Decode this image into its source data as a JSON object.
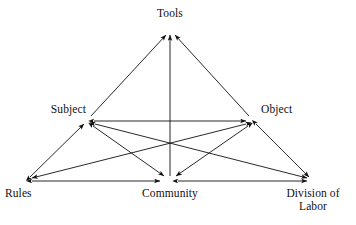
{
  "diagram": {
    "type": "activity-theory-triangle",
    "background_color": "#ffffff",
    "line_color": "#111111",
    "nodes": [
      {
        "id": "tools",
        "label": "Tools",
        "x": 170,
        "y": 30
      },
      {
        "id": "subject",
        "label": "Subject",
        "x": 88,
        "y": 120
      },
      {
        "id": "object",
        "label": "Object",
        "x": 252,
        "y": 120
      },
      {
        "id": "rules",
        "label": "Rules",
        "x": 26,
        "y": 181
      },
      {
        "id": "community",
        "label": "Community",
        "x": 169,
        "y": 181
      },
      {
        "id": "division",
        "label_line1": "Division of",
        "label_line2": "Labor",
        "x": 313,
        "y": 181
      }
    ],
    "edges": [
      {
        "from": "subject",
        "to": "tools",
        "arrows": "to"
      },
      {
        "from": "object",
        "to": "tools",
        "arrows": "to"
      },
      {
        "from": "community",
        "to": "tools",
        "arrows": "to"
      },
      {
        "from": "subject",
        "to": "object",
        "arrows": "both"
      },
      {
        "from": "subject",
        "to": "rules",
        "arrows": "both"
      },
      {
        "from": "object",
        "to": "division",
        "arrows": "both"
      },
      {
        "from": "subject",
        "to": "community",
        "arrows": "both"
      },
      {
        "from": "object",
        "to": "community",
        "arrows": "both"
      },
      {
        "from": "subject",
        "to": "division",
        "arrows": "both"
      },
      {
        "from": "object",
        "to": "rules",
        "arrows": "both"
      },
      {
        "from": "rules",
        "to": "community",
        "arrows": "both"
      },
      {
        "from": "community",
        "to": "division",
        "arrows": "both"
      }
    ]
  }
}
